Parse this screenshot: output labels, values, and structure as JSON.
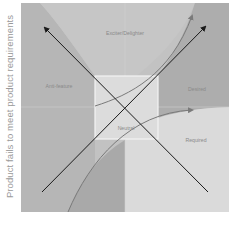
{
  "diagram": {
    "type": "kano-model",
    "y_axis_label": "Product fails to meet product requirements",
    "regions": [
      {
        "id": "exciter",
        "label": "Exciter/Delighter",
        "color": "#c4c4c4"
      },
      {
        "id": "anti",
        "label": "Anti-feature",
        "color": "#b9b9b9"
      },
      {
        "id": "desired",
        "label": "Desired",
        "color": "#b0b0b0"
      },
      {
        "id": "required",
        "label": "Required",
        "color": "#d9d9d9"
      },
      {
        "id": "neutral",
        "label": "Neutral",
        "color": "#dedede"
      }
    ],
    "arrows": [
      {
        "id": "diag-up-left",
        "from": "bottom-right",
        "to": "top-left",
        "color": "#1a1a1a"
      },
      {
        "id": "diag-up-right",
        "from": "bottom-left",
        "to": "top-right",
        "color": "#1a1a1a"
      },
      {
        "id": "exciter-curve",
        "color": "#7a7a7a"
      },
      {
        "id": "required-curve",
        "color": "#7a7a7a"
      }
    ]
  }
}
